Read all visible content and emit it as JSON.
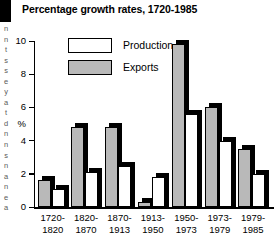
{
  "edge": {
    "block": "",
    "letters": "n\nn\nt\ns\ns\ne\ny\na\nt\nd\nn\nn\ns\nn\na\nn\ne\na"
  },
  "chart_data": {
    "type": "bar",
    "title": "Percentage growth rates, 1720-1985",
    "xlabel": "",
    "ylabel": "%",
    "ylim": [
      0,
      10
    ],
    "yticks": [
      0,
      2,
      4,
      6,
      8,
      10
    ],
    "ytick_labels": [
      "0",
      "2",
      "4",
      "6",
      "8",
      "10"
    ],
    "grid": false,
    "legend_position": "top-left",
    "categories": [
      "1720-1820",
      "1820-1870",
      "1870-1913",
      "1913-1950",
      "1950-1973",
      "1973-1979",
      "1979-1985"
    ],
    "category_lines": [
      [
        "1720-",
        "1820"
      ],
      [
        "1820-",
        "1870"
      ],
      [
        "1870-",
        "1913"
      ],
      [
        "1913-",
        "1950"
      ],
      [
        "1950-",
        "1973"
      ],
      [
        "1973-",
        "1979"
      ],
      [
        "1979-",
        "1985"
      ]
    ],
    "series": [
      {
        "name": "Exports",
        "color": "#b9b9b9",
        "values": [
          1.6,
          4.8,
          4.8,
          0.3,
          9.8,
          6.0,
          3.5
        ]
      },
      {
        "name": "Production",
        "color": "#ffffff",
        "values": [
          1.1,
          2.1,
          2.5,
          1.8,
          5.6,
          4.0,
          2.0
        ]
      }
    ]
  }
}
